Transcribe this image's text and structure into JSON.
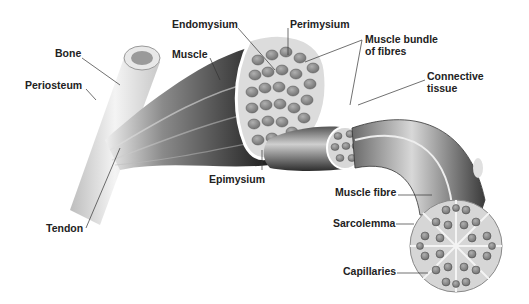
{
  "diagram": {
    "labels": {
      "bone": "Bone",
      "periosteum": "Periosteum",
      "tendon": "Tendon",
      "endomysium": "Endomysium",
      "muscle": "Muscle",
      "perimysium": "Perimysium",
      "muscle_bundle_1": "Muscle bundle",
      "muscle_bundle_2": "of fibres",
      "connective_1": "Connective",
      "connective_2": "tissue",
      "epimysium": "Epimysium",
      "muscle_fibre": "Muscle fibre",
      "sarcolemma": "Sarcolemma",
      "capillaries": "Capillaries"
    },
    "colors": {
      "label_text": "#222222",
      "leader_line": "#333333",
      "muscle_dark": "#2a2a2a",
      "fibre_grey": "#8a8a8a",
      "bone": "#e6e6e6"
    }
  }
}
